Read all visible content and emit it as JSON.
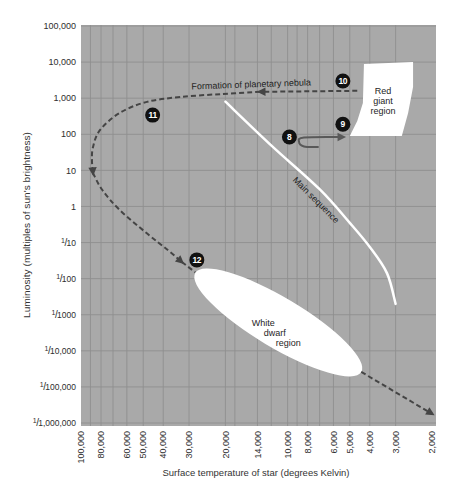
{
  "chart_data": {
    "type": "line",
    "title": "",
    "xlabel": "Surface temperature of star (degrees Kelvin)",
    "ylabel": "Luminosity (multiples of sun's brightness)",
    "x_scale": "log",
    "y_scale": "log",
    "x_reversed": true,
    "xlim": [
      100000,
      2000
    ],
    "ylim": [
      1e-06,
      100000
    ],
    "grid": true,
    "legend": "none",
    "background_color": "#a9a9a9",
    "grid_color": "#8e8e8e",
    "marker_color": "#111111",
    "x_ticks": [
      {
        "value": 100000,
        "label": "100,000"
      },
      {
        "value": 80000,
        "label": "80,000"
      },
      {
        "value": 60000,
        "label": "60,000"
      },
      {
        "value": 50000,
        "label": "50,000"
      },
      {
        "value": 40000,
        "label": "40,000"
      },
      {
        "value": 30000,
        "label": "30,000"
      },
      {
        "value": 20000,
        "label": "20,000"
      },
      {
        "value": 14000,
        "label": "14,000"
      },
      {
        "value": 10000,
        "label": "10,000"
      },
      {
        "value": 8000,
        "label": "8,000"
      },
      {
        "value": 6000,
        "label": "6,000"
      },
      {
        "value": 5000,
        "label": "5,000"
      },
      {
        "value": 4000,
        "label": "4,000"
      },
      {
        "value": 3000,
        "label": "3,000"
      },
      {
        "value": 2000,
        "label": "2,000"
      }
    ],
    "x_minor_gridlines": [
      90000,
      70000,
      18000,
      12000,
      9000,
      7000
    ],
    "y_ticks": [
      {
        "value": 100000,
        "label": "100,000"
      },
      {
        "value": 10000,
        "label": "10,000"
      },
      {
        "value": 1000,
        "label": "1,000"
      },
      {
        "value": 100,
        "label": "100"
      },
      {
        "value": 10,
        "label": "10"
      },
      {
        "value": 1,
        "label": "1"
      },
      {
        "value": 0.1,
        "label": "1/10"
      },
      {
        "value": 0.01,
        "label": "1/100"
      },
      {
        "value": 0.001,
        "label": "1/1000"
      },
      {
        "value": 0.0001,
        "label": "1/10,000"
      },
      {
        "value": 1e-05,
        "label": "1/100,000"
      },
      {
        "value": 1e-06,
        "label": "1/1,000,000"
      }
    ],
    "regions": [
      {
        "label_lines": [
          "Red",
          "giant",
          "region"
        ],
        "shape": "polygon",
        "fill": "#ffffff",
        "points": [
          [
            4270,
            8850
          ],
          [
            2470,
            10000
          ],
          [
            2470,
            2040
          ],
          [
            2610,
            390
          ],
          [
            2800,
            90
          ],
          [
            5000,
            90
          ],
          [
            4600,
            235
          ],
          [
            4320,
            740
          ]
        ],
        "label_at": [
          3450,
          840
        ],
        "label_align": "center"
      },
      {
        "label_lines": [
          "White",
          "dwarf",
          "region"
        ],
        "shape": "ellipse",
        "fill": "#ffffff",
        "tip_a": [
          28000,
          0.0144
        ],
        "tip_b": [
          4400,
          2.6e-05
        ],
        "half_width_px": 25,
        "label_at": [
          14900,
          0.0005
        ],
        "label_align": "stagger"
      }
    ],
    "series": [
      {
        "id": "main-sequence-curve",
        "label": "Main sequence",
        "style": "solid",
        "color": "#ffffff",
        "width": 2.5,
        "segments": [
          {
            "points": [
              [
                20000,
                800
              ],
              [
                11900,
                47
              ],
              [
                7000,
                3
              ],
              [
                5000,
                0.35
              ],
              [
                4000,
                0.075
              ],
              [
                3300,
                0.014
              ],
              [
                3000,
                0.002
              ]
            ],
            "arrow_end": false
          }
        ]
      },
      {
        "id": "stage-8-to-9-path",
        "label": "",
        "style": "solid",
        "color": "#595959",
        "width": 2,
        "segments": [
          {
            "points": [
              [
                7130,
                44.5
              ],
              [
                8330,
                46
              ],
              [
                8800,
                61
              ],
              [
                8330,
                81.5
              ],
              [
                5390,
                84
              ]
            ],
            "arrow_end": true
          }
        ]
      },
      {
        "id": "planetary-nebula-path",
        "label": "Formation of planetary nebula",
        "style": "dashed",
        "color": "#454545",
        "width": 2,
        "segments": [
          {
            "points": [
              [
                4600,
                1600
              ],
              [
                13600,
                1500
              ]
            ],
            "arrow_end": true
          },
          {
            "points": [
              [
                13600,
                1500
              ],
              [
                21000,
                1300
              ],
              [
                33000,
                1080
              ],
              [
                48000,
                790
              ],
              [
                65000,
                390
              ],
              [
                81000,
                130
              ],
              [
                87500,
                44
              ],
              [
                88500,
                19
              ],
              [
                87500,
                8.5
              ]
            ],
            "arrow_end": true
          },
          {
            "points": [
              [
                87500,
                8.5
              ],
              [
                79000,
                2.9
              ],
              [
                65000,
                0.8
              ],
              [
                48000,
                0.18
              ],
              [
                38000,
                0.062
              ],
              [
                32500,
                0.029
              ]
            ],
            "arrow_end": true
          },
          {
            "points": [
              [
                32500,
                0.029
              ],
              [
                28000,
                0.015
              ]
            ],
            "arrow_end": false
          },
          {
            "points": [
              [
                4400,
                2.6e-05
              ],
              [
                2000,
                1.8e-06
              ]
            ],
            "arrow_end": true
          }
        ]
      }
    ],
    "markers": [
      {
        "label": "8",
        "at": [
          9800,
          84
        ]
      },
      {
        "label": "9",
        "at": [
          5400,
          190
        ]
      },
      {
        "label": "10",
        "at": [
          5400,
          3000
        ]
      },
      {
        "label": "11",
        "at": [
          45000,
          340
        ]
      },
      {
        "label": "12",
        "at": [
          27500,
          0.033
        ]
      }
    ],
    "annotations": [
      {
        "text": "Formation of planetary nebula",
        "at": [
          15000,
          2000
        ],
        "rotate": -2
      },
      {
        "text": "Main sequence",
        "at": [
          7460,
          1.32
        ],
        "rotate": 45
      }
    ]
  }
}
